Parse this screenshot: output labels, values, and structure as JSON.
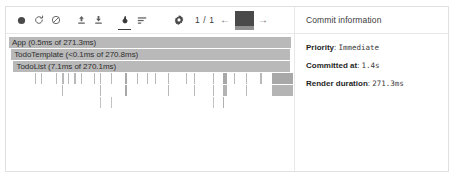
{
  "toolbar": {
    "record_label": "Start profiling",
    "reload_label": "Reload and start profiling",
    "clear_label": "Clear profiling data",
    "import_label": "Load profile",
    "export_label": "Save profile",
    "flamegraph_label": "Flamegraph chart",
    "ranked_label": "Ranked chart",
    "settings_label": "Settings",
    "commit_counter": "1 / 1",
    "prev_label": "←",
    "next_label": "→",
    "snapshot_label": "commit-snapshot"
  },
  "commit_panel": {
    "title": "Commit information",
    "rows": [
      {
        "key": "Priority",
        "sep": ": ",
        "value": "Immediate"
      },
      {
        "key": "Committed at",
        "sep": ": ",
        "value": "1.4s"
      },
      {
        "key": "Render duration",
        "sep": ": ",
        "value": "271.3ms"
      }
    ]
  },
  "chart_data": {
    "type": "bar",
    "xlabel": "",
    "ylabel": "",
    "units": "ms",
    "total_duration_ms": 271.3,
    "colors": {
      "bar": "#b9b9b9",
      "bar_dark": "#a8a8a8",
      "text": "#2e2e2e"
    },
    "rows": [
      {
        "depth": 0,
        "bars": [
          {
            "label": "App (0.5ms of 271.3ms)",
            "name": "App",
            "self_ms": 0.5,
            "total_ms": 271.3,
            "left_pct": 1.0,
            "width_pct": 98.3,
            "color": "#b9b9b9"
          }
        ]
      },
      {
        "depth": 1,
        "bars": [
          {
            "label": "TodoTemplate (<0.1ms of 270.8ms)",
            "name": "TodoTemplate",
            "self_ms": 0.1,
            "total_ms": 270.8,
            "left_pct": 1.8,
            "width_pct": 97.3,
            "color": "#b9b9b9"
          }
        ]
      },
      {
        "depth": 2,
        "bars": [
          {
            "label": "TodoList (7.1ms of 270.1ms)",
            "name": "TodoList",
            "self_ms": 7.1,
            "total_ms": 270.1,
            "left_pct": 2.6,
            "width_pct": 96.3,
            "color": "#b9b9b9"
          }
        ]
      },
      {
        "depth": 3,
        "bars": [
          {
            "label": "",
            "left_pct": 10.2,
            "width_pct": 0.7,
            "color": "#b9b9b9"
          },
          {
            "label": "",
            "left_pct": 12.1,
            "width_pct": 0.7,
            "color": "#b9b9b9"
          },
          {
            "label": "",
            "left_pct": 17.5,
            "width_pct": 0.7,
            "color": "#b9b9b9"
          },
          {
            "label": "",
            "left_pct": 19.6,
            "width_pct": 0.9,
            "color": "#b9b9b9"
          },
          {
            "label": "",
            "left_pct": 21.4,
            "width_pct": 0.7,
            "color": "#b9b9b9"
          },
          {
            "label": "",
            "left_pct": 23.6,
            "width_pct": 0.9,
            "color": "#b9b9b9"
          },
          {
            "label": "",
            "left_pct": 25.9,
            "width_pct": 0.7,
            "color": "#b9b9b9"
          },
          {
            "label": "",
            "left_pct": 30.4,
            "width_pct": 0.7,
            "color": "#b9b9b9"
          },
          {
            "label": "",
            "left_pct": 32.8,
            "width_pct": 0.7,
            "color": "#b9b9b9"
          },
          {
            "label": "",
            "left_pct": 36.6,
            "width_pct": 0.7,
            "color": "#b9b9b9"
          },
          {
            "label": "",
            "left_pct": 41.3,
            "width_pct": 1.1,
            "color": "#a8a8a8"
          },
          {
            "label": "",
            "left_pct": 45.6,
            "width_pct": 0.7,
            "color": "#b9b9b9"
          },
          {
            "label": "",
            "left_pct": 48.8,
            "width_pct": 0.7,
            "color": "#b9b9b9"
          },
          {
            "label": "",
            "left_pct": 51.9,
            "width_pct": 0.7,
            "color": "#b9b9b9"
          },
          {
            "label": "",
            "left_pct": 56.3,
            "width_pct": 0.7,
            "color": "#b9b9b9"
          },
          {
            "label": "",
            "left_pct": 62.4,
            "width_pct": 0.7,
            "color": "#b9b9b9"
          },
          {
            "label": "",
            "left_pct": 64.2,
            "width_pct": 0.5,
            "color": "#b9b9b9"
          },
          {
            "label": "",
            "left_pct": 65.3,
            "width_pct": 0.5,
            "color": "#b9b9b9"
          },
          {
            "label": "",
            "left_pct": 72.0,
            "width_pct": 0.7,
            "color": "#b9b9b9"
          },
          {
            "label": "",
            "left_pct": 75.4,
            "width_pct": 1.8,
            "color": "#a8a8a8"
          },
          {
            "label": "",
            "left_pct": 79.2,
            "width_pct": 0.7,
            "color": "#b9b9b9"
          },
          {
            "label": "",
            "left_pct": 83.5,
            "width_pct": 0.7,
            "color": "#b9b9b9"
          },
          {
            "label": "",
            "left_pct": 88.2,
            "width_pct": 0.9,
            "color": "#b9b9b9"
          },
          {
            "label": "",
            "left_pct": 92.4,
            "width_pct": 7.6,
            "color": "#a8a8a8"
          }
        ]
      },
      {
        "depth": 4,
        "bars": [
          {
            "label": "",
            "left_pct": 12.1,
            "width_pct": 0.5,
            "color": "#b9b9b9"
          },
          {
            "label": "",
            "left_pct": 19.6,
            "width_pct": 0.5,
            "color": "#b9b9b9"
          },
          {
            "label": "",
            "left_pct": 21.4,
            "width_pct": 0.5,
            "color": "#b9b9b9"
          },
          {
            "label": "",
            "left_pct": 23.6,
            "width_pct": 0.5,
            "color": "#b9b9b9"
          },
          {
            "label": "",
            "left_pct": 25.9,
            "width_pct": 0.5,
            "color": "#b9b9b9"
          },
          {
            "label": "",
            "left_pct": 32.8,
            "width_pct": 0.5,
            "color": "#b9b9b9"
          },
          {
            "label": "",
            "left_pct": 41.3,
            "width_pct": 0.9,
            "color": "#a8a8a8"
          },
          {
            "label": "",
            "left_pct": 48.8,
            "width_pct": 0.5,
            "color": "#b9b9b9"
          },
          {
            "label": "",
            "left_pct": 56.3,
            "width_pct": 0.5,
            "color": "#b9b9b9"
          },
          {
            "label": "",
            "left_pct": 64.2,
            "width_pct": 0.5,
            "color": "#b9b9b9"
          },
          {
            "label": "",
            "left_pct": 65.3,
            "width_pct": 0.5,
            "color": "#b9b9b9"
          },
          {
            "label": "",
            "left_pct": 72.0,
            "width_pct": 0.5,
            "color": "#b9b9b9"
          },
          {
            "label": "",
            "left_pct": 75.4,
            "width_pct": 1.8,
            "color": "#b4b4b4"
          },
          {
            "label": "",
            "left_pct": 83.5,
            "width_pct": 0.5,
            "color": "#b9b9b9"
          },
          {
            "label": "",
            "left_pct": 92.4,
            "width_pct": 7.6,
            "color": "#b4b4b4"
          }
        ]
      },
      {
        "depth": 5,
        "bars": [
          {
            "label": "",
            "left_pct": 21.4,
            "width_pct": 0.4,
            "color": "#c2c2c2"
          },
          {
            "label": "",
            "left_pct": 25.9,
            "width_pct": 0.4,
            "color": "#c2c2c2"
          },
          {
            "label": "",
            "left_pct": 32.8,
            "width_pct": 0.4,
            "color": "#c2c2c2"
          },
          {
            "label": "",
            "left_pct": 36.6,
            "width_pct": 0.4,
            "color": "#c2c2c2"
          },
          {
            "label": "",
            "left_pct": 41.3,
            "width_pct": 0.5,
            "color": "#b0b0b0"
          },
          {
            "label": "",
            "left_pct": 48.8,
            "width_pct": 0.4,
            "color": "#c2c2c2"
          },
          {
            "label": "",
            "left_pct": 56.3,
            "width_pct": 0.4,
            "color": "#c9c9c9"
          },
          {
            "label": "",
            "left_pct": 72.0,
            "width_pct": 0.4,
            "color": "#c2c2c2"
          },
          {
            "label": "",
            "left_pct": 75.4,
            "width_pct": 0.7,
            "color": "#b0b0b0"
          }
        ]
      }
    ]
  }
}
